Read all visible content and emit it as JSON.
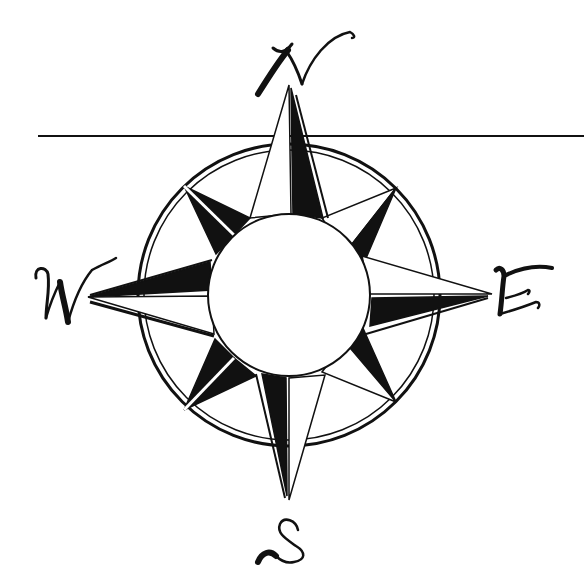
{
  "figure": {
    "colors": {
      "ink": "#111111",
      "paper": "#ffffff"
    },
    "center": [
      289,
      295
    ],
    "inner_radius": 80,
    "outer_radius": 150,
    "horizon_line": {
      "x1": 38,
      "x2": 584,
      "y": 136
    },
    "cardinal_points": [
      {
        "label": "N",
        "tip": [
          289,
          85
        ]
      },
      {
        "label": "E",
        "tip": [
          492,
          294
        ]
      },
      {
        "label": "S",
        "tip": [
          289,
          500
        ]
      },
      {
        "label": "W",
        "tip": [
          88,
          297
        ]
      }
    ],
    "intercardinal_points": [
      {
        "label": "NE",
        "tip": [
          396,
          188
        ]
      },
      {
        "label": "SE",
        "tip": [
          396,
          402
        ]
      },
      {
        "label": "SW",
        "tip": [
          184,
          410
        ]
      },
      {
        "label": "NW",
        "tip": [
          184,
          186
        ]
      }
    ]
  }
}
